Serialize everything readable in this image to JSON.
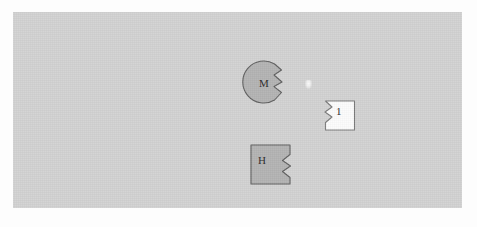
{
  "canvas": {
    "background_color": "#d2d2d2",
    "page_background_color": "#fdfdfd",
    "border_color": "#c4c4c4"
  },
  "pieces": [
    {
      "id": "m",
      "label": "M",
      "shape": "circle-with-right-v-notch",
      "fill_color": "#b3b3b3",
      "stroke_color": "#5e5e5e"
    },
    {
      "id": "h",
      "label": "H",
      "shape": "square-with-right-v-notch",
      "fill_color": "#b3b3b3",
      "stroke_color": "#5e5e5e"
    },
    {
      "id": "one",
      "label": "1",
      "shape": "square-with-left-v-notch",
      "fill_color": "#fcfcfc",
      "stroke_color": "#7a7a7a"
    }
  ],
  "marker": {
    "name": "highlight-speck",
    "color": "#ffffff"
  }
}
